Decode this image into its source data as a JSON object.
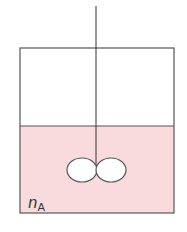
{
  "diagram": {
    "label": {
      "symbol": "n",
      "subscript": "A"
    },
    "colors": {
      "liquid": "#f9dadd",
      "outline": "#555555",
      "background": "#ffffff",
      "impeller_fill": "#ffffff"
    },
    "vessel": {
      "x": 20,
      "y": 48,
      "width": 154,
      "height": 165
    },
    "liquid_level_y": 126,
    "shaft": {
      "x": 96,
      "y_top": 6,
      "y_bottom": 170
    },
    "impeller": [
      {
        "cx": 82,
        "cy": 170,
        "rx": 15,
        "ry": 12
      },
      {
        "cx": 111,
        "cy": 170,
        "rx": 15,
        "ry": 12
      }
    ]
  }
}
